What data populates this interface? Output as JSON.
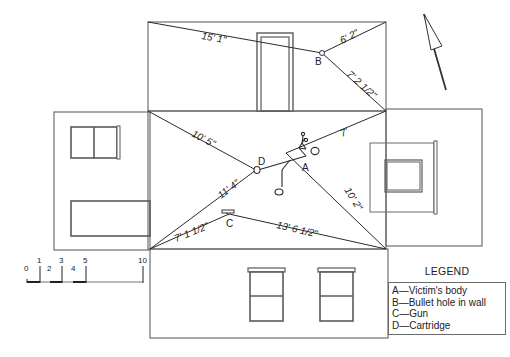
{
  "diagram": {
    "type": "crime-scene-sketch",
    "style": "exploded room view (floor with walls folded out)",
    "measurements": {
      "b_top_left": "15' 1\"",
      "b_top_right": "6' 2\"",
      "b_bottom_right": "7' 2 1/2\"",
      "d_top_left": "10' 5\"",
      "d_bottom_left": "11' 4\"",
      "a_top_right": "7'",
      "a_bottom_right": "10' 2\"",
      "c_bottom_left": "7' 1 1/2\"",
      "c_bottom_right": "13' 6 1/2\""
    },
    "markers": {
      "a": "A",
      "b": "B",
      "c": "C",
      "d": "D"
    }
  },
  "scale": {
    "ticks": [
      "0",
      "1",
      "2",
      "3",
      "4",
      "5",
      "10"
    ]
  },
  "legend": {
    "title": "LEGEND",
    "items": [
      "A—Victim's body",
      "B—Bullet hole in wall",
      "C—Gun",
      "D—Cartridge"
    ]
  },
  "north_arrow": {
    "icon": "north-arrow-icon"
  }
}
